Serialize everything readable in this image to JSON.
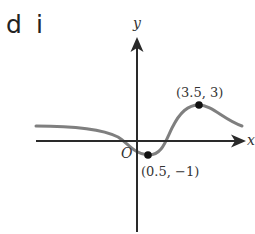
{
  "part_label": {
    "letter": "d",
    "roman": "i"
  },
  "axes": {
    "x_label": "x",
    "y_label": "y",
    "origin_label": "O"
  },
  "points": [
    {
      "label": "(3.5, 3)",
      "x": 3.5,
      "y": 3,
      "type": "maximum"
    },
    {
      "label": "(0.5, -1)",
      "display": "(0.5, −1)",
      "x": 0.5,
      "y": -1,
      "type": "minimum"
    }
  ],
  "colors": {
    "axis": "#2a2a2a",
    "curve": "#7f7f7f",
    "point": "#111111",
    "text": "#333333"
  }
}
